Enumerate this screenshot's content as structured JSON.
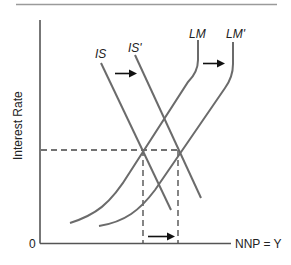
{
  "diagram": {
    "type": "IS-LM diagram",
    "y_axis_label": "Interest Rate",
    "x_axis_label": "NNP = Y",
    "origin_label": "0",
    "curves": [
      {
        "id": "IS",
        "label": "IS",
        "kind": "downward-sloping"
      },
      {
        "id": "IS_prime",
        "label": "IS'",
        "kind": "downward-sloping",
        "shifted_from": "IS"
      },
      {
        "id": "LM",
        "label": "LM",
        "kind": "upward-sloping"
      },
      {
        "id": "LM_prime",
        "label": "LM'",
        "kind": "upward-sloping",
        "shifted_from": "LM"
      }
    ],
    "shifts": [
      {
        "from": "IS",
        "to": "IS'",
        "direction": "right"
      },
      {
        "from": "LM",
        "to": "LM'",
        "direction": "right"
      }
    ],
    "equilibria": [
      {
        "id": "E1",
        "intersection": [
          "IS",
          "LM"
        ],
        "interest_rate": "unchanged"
      },
      {
        "id": "E2",
        "intersection": [
          "IS'",
          "LM'"
        ],
        "interest_rate": "unchanged"
      }
    ],
    "output_change_arrow": {
      "direction": "right",
      "meaning": "increase in NNP"
    },
    "colors": {
      "curves": "#6b6b6b",
      "axes": "#555555",
      "arrows": "#111111",
      "rule": "#999999"
    }
  }
}
